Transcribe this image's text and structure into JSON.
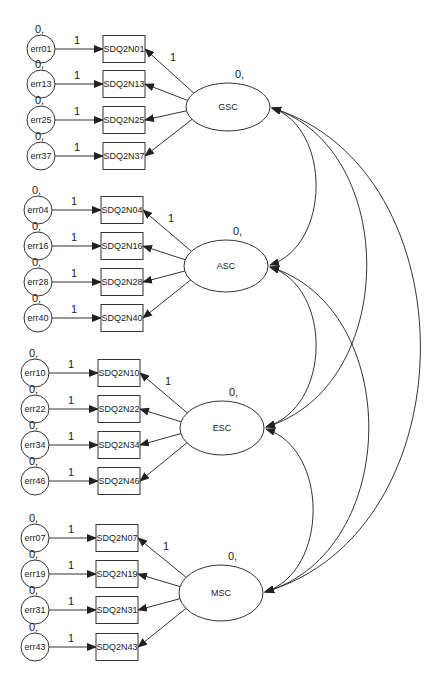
{
  "diagram": {
    "type": "structural-equation-model",
    "arrow_color": "#222222",
    "line_color": "#333333",
    "latent_factors": [
      {
        "id": "GSC",
        "label": "GSC",
        "variance_label": "0,",
        "cx": 228,
        "cy": 107,
        "rx": 42,
        "ry": 24
      },
      {
        "id": "ASC",
        "label": "ASC",
        "variance_label": "0,",
        "cx": 226,
        "cy": 266,
        "rx": 42,
        "ry": 26
      },
      {
        "id": "ESC",
        "label": "ESC",
        "variance_label": "0,",
        "cx": 222,
        "cy": 428,
        "rx": 42,
        "ry": 27
      },
      {
        "id": "MSC",
        "label": "MSC",
        "variance_label": "0,",
        "cx": 221,
        "cy": 593,
        "rx": 42,
        "ry": 28
      }
    ],
    "groups": [
      {
        "factor": "GSC",
        "first_loading_label": "1",
        "items": [
          {
            "indicator": "SDQ2N01",
            "error": "err01",
            "error_var_label": "0,",
            "path_label": "1",
            "ex": 41,
            "y": 49,
            "bx": 103
          },
          {
            "indicator": "SDQ2N13",
            "error": "err13",
            "error_var_label": "0,",
            "path_label": "1",
            "ex": 41,
            "y": 84,
            "bx": 103
          },
          {
            "indicator": "SDQ2N25",
            "error": "err25",
            "error_var_label": "0,",
            "path_label": "1",
            "ex": 41,
            "y": 120,
            "bx": 103
          },
          {
            "indicator": "SDQ2N37",
            "error": "err37",
            "error_var_label": "0,",
            "path_label": "1",
            "ex": 41,
            "y": 156,
            "bx": 103
          }
        ]
      },
      {
        "factor": "ASC",
        "first_loading_label": "1",
        "items": [
          {
            "indicator": "SDQ2N04",
            "error": "err04",
            "error_var_label": "0,",
            "path_label": "1",
            "ex": 38,
            "y": 210,
            "bx": 101
          },
          {
            "indicator": "SDQ2N16",
            "error": "err16",
            "error_var_label": "0,",
            "path_label": "1",
            "ex": 38,
            "y": 246,
            "bx": 101
          },
          {
            "indicator": "SDQ2N28",
            "error": "err28",
            "error_var_label": "0,",
            "path_label": "1",
            "ex": 38,
            "y": 282,
            "bx": 101
          },
          {
            "indicator": "SDQ2N40",
            "error": "err40",
            "error_var_label": "0,",
            "path_label": "1",
            "ex": 38,
            "y": 318,
            "bx": 101
          }
        ]
      },
      {
        "factor": "ESC",
        "first_loading_label": "1",
        "items": [
          {
            "indicator": "SDQ2N10",
            "error": "err10",
            "error_var_label": "0,",
            "path_label": "1",
            "ex": 35,
            "y": 373,
            "bx": 98
          },
          {
            "indicator": "SDQ2N22",
            "error": "err22",
            "error_var_label": "0,",
            "path_label": "1",
            "ex": 35,
            "y": 409,
            "bx": 98
          },
          {
            "indicator": "SDQ2N34",
            "error": "err34",
            "error_var_label": "0,",
            "path_label": "1",
            "ex": 35,
            "y": 445,
            "bx": 98
          },
          {
            "indicator": "SDQ2N46",
            "error": "err46",
            "error_var_label": "0,",
            "path_label": "1",
            "ex": 35,
            "y": 481,
            "bx": 98
          }
        ]
      },
      {
        "factor": "MSC",
        "first_loading_label": "1",
        "items": [
          {
            "indicator": "SDQ2N07",
            "error": "err07",
            "error_var_label": "0,",
            "path_label": "1",
            "ex": 35,
            "y": 538,
            "bx": 96
          },
          {
            "indicator": "SDQ2N19",
            "error": "err19",
            "error_var_label": "0,",
            "path_label": "1",
            "ex": 35,
            "y": 574,
            "bx": 96
          },
          {
            "indicator": "SDQ2N31",
            "error": "err31",
            "error_var_label": "0,",
            "path_label": "1",
            "ex": 35,
            "y": 610,
            "bx": 96
          },
          {
            "indicator": "SDQ2N43",
            "error": "err43",
            "error_var_label": "0,",
            "path_label": "1",
            "ex": 35,
            "y": 647,
            "bx": 96
          }
        ]
      }
    ],
    "covariances": [
      {
        "from": "GSC",
        "to": "ASC",
        "bulge_x": 315
      },
      {
        "from": "GSC",
        "to": "ESC",
        "bulge_x": 365
      },
      {
        "from": "GSC",
        "to": "MSC",
        "bulge_x": 418
      },
      {
        "from": "ASC",
        "to": "ESC",
        "bulge_x": 315
      },
      {
        "from": "ASC",
        "to": "MSC",
        "bulge_x": 367
      },
      {
        "from": "ESC",
        "to": "MSC",
        "bulge_x": 312
      }
    ]
  }
}
